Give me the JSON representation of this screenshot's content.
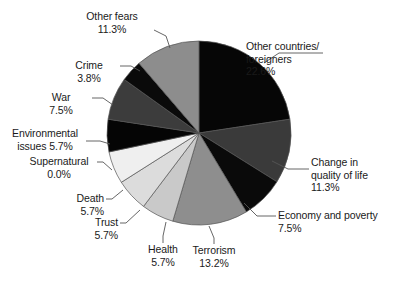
{
  "chart_data": {
    "type": "pie",
    "title": "",
    "units": "percent",
    "legend": "none",
    "labels_position": "outside-with-leader-lines",
    "start_angle_deg": 0,
    "direction": "clockwise",
    "categories": [
      "Other countries/\nforeigners",
      "Change in\nquality of life",
      "Economy and poverty",
      "Terrorism",
      "Health",
      "Trust",
      "Death",
      "Supernatural",
      "Environmental\nissues",
      "War",
      "Crime",
      "Other fears"
    ],
    "values": [
      22.6,
      11.3,
      7.5,
      13.2,
      5.7,
      5.7,
      5.7,
      0.0,
      5.7,
      7.5,
      3.8,
      11.3
    ],
    "value_labels": [
      "22.6%",
      "11.3%",
      "7.5%",
      "13.2%",
      "5.7%",
      "5.7%",
      "5.7%",
      "0.0%",
      "5.7%",
      "7.5%",
      "3.8%",
      "11.3%"
    ],
    "slice_colors": [
      "#060606",
      "#3a3a3a",
      "#0a0a0a",
      "#8e8e8e",
      "#c9c9c9",
      "#dcdcdc",
      "#efefef",
      "#ffffff",
      "#050505",
      "#3c3c3c",
      "#0a0a0a",
      "#8d8d8d"
    ],
    "outline_color": "#555555"
  },
  "slices": [
    {
      "name": "other-countries-foreigners",
      "label": "Other countries/\nforeigners\n22.6%",
      "label_text": "Other countries/\nforeigners",
      "percent_text": "22.6%"
    },
    {
      "name": "change-in-quality-of-life",
      "label": "Change in\nquality of life\n11.3%",
      "label_text": "Change in\nquality of life",
      "percent_text": "11.3%"
    },
    {
      "name": "economy-and-poverty",
      "label": "Economy and poverty\n7.5%",
      "label_text": "Economy and poverty",
      "percent_text": "7.5%"
    },
    {
      "name": "terrorism",
      "label": "Terrorism\n13.2%",
      "label_text": "Terrorism",
      "percent_text": "13.2%"
    },
    {
      "name": "health",
      "label": "Health\n5.7%",
      "label_text": "Health",
      "percent_text": "5.7%"
    },
    {
      "name": "trust",
      "label": "Trust\n5.7%",
      "label_text": "Trust",
      "percent_text": "5.7%"
    },
    {
      "name": "death",
      "label": "Death\n5.7%",
      "label_text": "Death",
      "percent_text": "5.7%"
    },
    {
      "name": "supernatural",
      "label": "Supernatural\n0.0%",
      "label_text": "Supernatural",
      "percent_text": "0.0%"
    },
    {
      "name": "environmental-issues",
      "label": "Environmental\nissues 5.7%",
      "label_text": "Environmental",
      "percent_text": "issues 5.7%"
    },
    {
      "name": "war",
      "label": "War\n7.5%",
      "label_text": "War",
      "percent_text": "7.5%"
    },
    {
      "name": "crime",
      "label": "Crime\n3.8%",
      "label_text": "Crime",
      "percent_text": "3.8%"
    },
    {
      "name": "other-fears",
      "label": "Other fears\n11.3%",
      "label_text": "Other fears",
      "percent_text": "11.3%"
    }
  ]
}
